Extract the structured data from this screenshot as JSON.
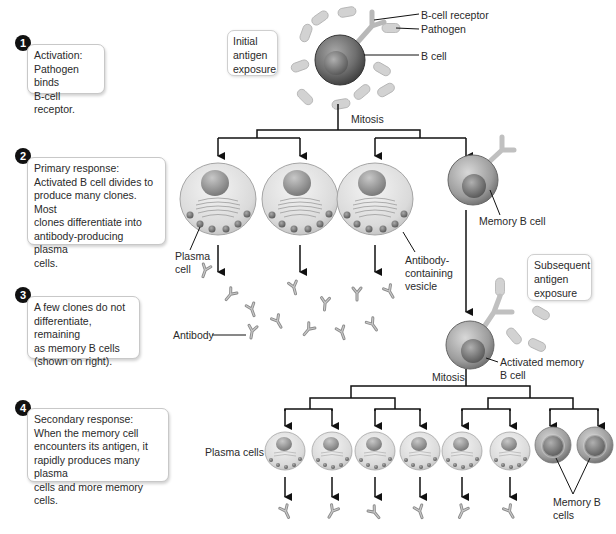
{
  "steps": [
    {
      "number": "1",
      "text": "Activation:\nPathogen binds\nB-cell receptor."
    },
    {
      "number": "2",
      "text": "Primary response:\nActivated B cell divides to\nproduce many  clones.  Most\nclones differentiate into\nantibody-producing plasma\ncells."
    },
    {
      "number": "3",
      "text": "A few clones do not\ndifferentiate, remaining\nas memory B cells\n(shown on right)."
    },
    {
      "number": "4",
      "text": "Secondary response:\nWhen the memory cell\nencounters its antigen, it\nrapidly produces many plasma\ncells and more memory cells."
    }
  ],
  "callouts": {
    "initial_exposure": "Initial\nantigen\nexposure",
    "subsequent_exposure": "Subsequent\nantigen\nexposure"
  },
  "labels": {
    "b_cell_receptor": "B-cell receptor",
    "pathogen": "Pathogen",
    "b_cell": "B cell",
    "mitosis_1": "Mitosis",
    "plasma_cell": "Plasma\ncell",
    "antibody_vesicle": "Antibody-\ncontaining\nvesicle",
    "memory_b_cell": "Memory B cell",
    "antibody": "Antibody",
    "activated_memory_b_cell": "Activated memory\nB cell",
    "mitosis_2": "Mitosis",
    "plasma_cells": "Plasma cells",
    "memory_b_cells": "Memory B\ncells"
  },
  "colors": {
    "line": "#111111",
    "box_border": "#c8c8c8",
    "cell_gray": "#9a9a9a",
    "pathogen": "#cfcfcf"
  }
}
